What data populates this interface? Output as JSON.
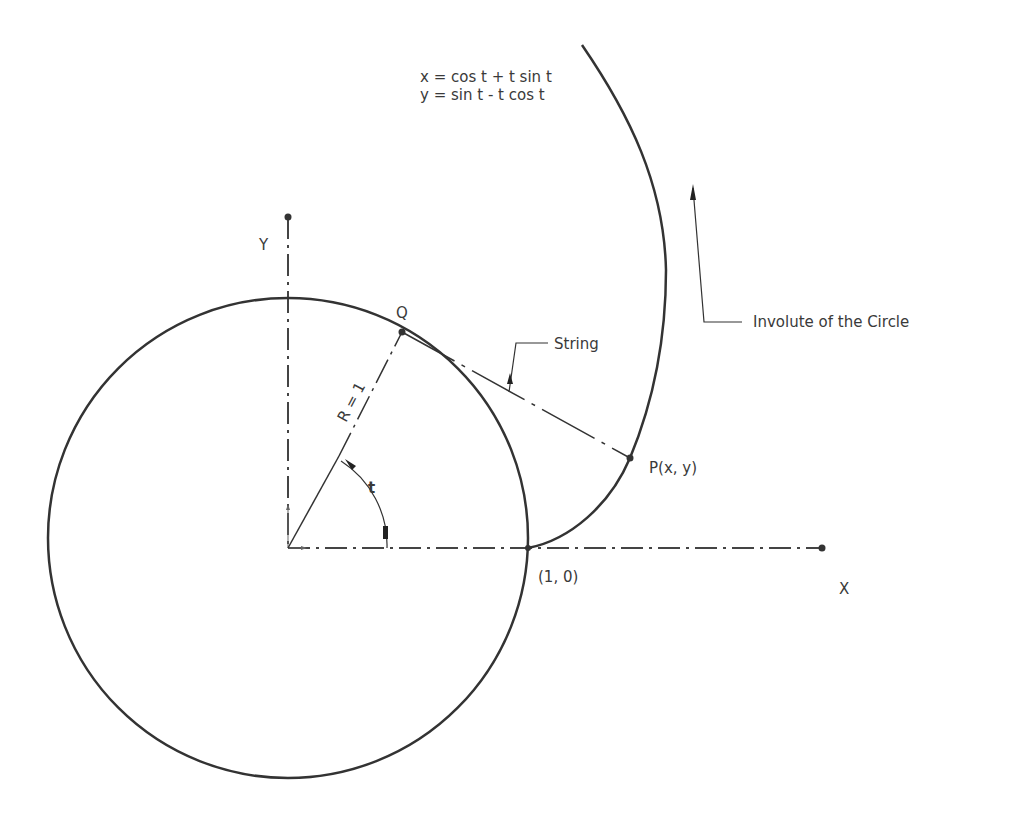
{
  "diagram": {
    "title": "Involute of the Circle",
    "equations": {
      "x": "x = cos t + t sin t",
      "y": "y = sin t - t cos t"
    },
    "labels": {
      "axis_x": "X",
      "axis_y": "Y",
      "point_q": "Q",
      "point_p": "P(x, y)",
      "start_point": "(1, 0)",
      "radius": "R = 1",
      "angle": "t",
      "string_callout": "String",
      "involute_callout": "Involute of the Circle"
    },
    "colors": {
      "stroke": "#333333",
      "text": "#3a3a3a",
      "background": "#ffffff"
    },
    "geometry": {
      "origin": [
        288,
        548
      ],
      "radius_px": 240,
      "point_q": [
        402,
        332
      ],
      "point_p": [
        630,
        458
      ],
      "start_point": [
        528,
        548
      ]
    }
  }
}
